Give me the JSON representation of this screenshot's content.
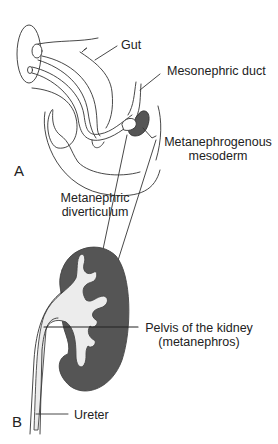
{
  "figure": {
    "colors": {
      "outline": "#333333",
      "tissue_fill": "#ececec",
      "mesoderm_fill": "#555555",
      "background": "#ffffff"
    },
    "parts": [
      {
        "id": "A",
        "label": "A"
      },
      {
        "id": "B",
        "label": "B"
      }
    ],
    "labels": {
      "gut": "Gut",
      "mesonephric_duct": "Mesonephric duct",
      "metanephrogenous_line1": "Metanephrogenous",
      "metanephrogenous_line2": "mesoderm",
      "diverticulum_line1": "Metanephric",
      "diverticulum_line2": "diverticulum",
      "pelvis_line1": "Pelvis of the kidney",
      "pelvis_line2": "(metanephros)",
      "ureter": "Ureter"
    }
  }
}
